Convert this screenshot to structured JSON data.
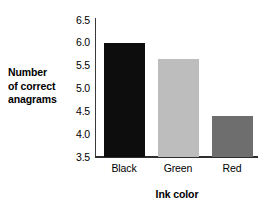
{
  "chart_data": {
    "type": "bar",
    "title": "",
    "categories": [
      "Black",
      "Green",
      "Red"
    ],
    "values": [
      6.0,
      5.65,
      4.4
    ],
    "series": [
      {
        "name": "Number of correct anagrams",
        "values": [
          6.0,
          5.65,
          4.4
        ]
      }
    ],
    "bar_colors": [
      "#0d0d0d",
      "#bdbdbd",
      "#6e6e6e"
    ],
    "xlabel": "Ink color",
    "ylabel": "Number of correct anagrams",
    "ylabel_lines": [
      "Number",
      "of correct",
      "anagrams"
    ],
    "ylim": [
      3.5,
      6.5
    ],
    "ytick_labels": [
      "6.5",
      "6.0",
      "5.5",
      "5.0",
      "4.5",
      "4.0",
      "3.5"
    ],
    "ytick_values": [
      6.5,
      6.0,
      5.5,
      5.0,
      4.5,
      4.0,
      3.5
    ],
    "grid": false,
    "legend": false,
    "legend_position": "none",
    "axis_color": "#2e2e2e",
    "background_color": "#ffffff",
    "annotations": []
  }
}
